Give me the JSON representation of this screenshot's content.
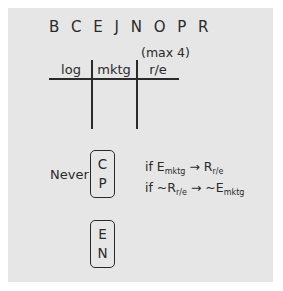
{
  "title_letters": "B C E J N O P R",
  "table": {
    "note": "(max 4)",
    "columns": [
      "log",
      "mktg",
      "r/e"
    ]
  },
  "never_label": "Never",
  "group_never": [
    "C",
    "P"
  ],
  "group_together": [
    "E",
    "N"
  ],
  "rules": [
    {
      "prefix": "if ",
      "a": "E",
      "a_sub": "mktg",
      "arrow": " → ",
      "b": "R",
      "b_sub": "r/e"
    },
    {
      "prefix": "if ",
      "a": "~R",
      "a_sub": "r/e",
      "arrow": " → ",
      "b": "~E",
      "b_sub": "mktg"
    }
  ]
}
